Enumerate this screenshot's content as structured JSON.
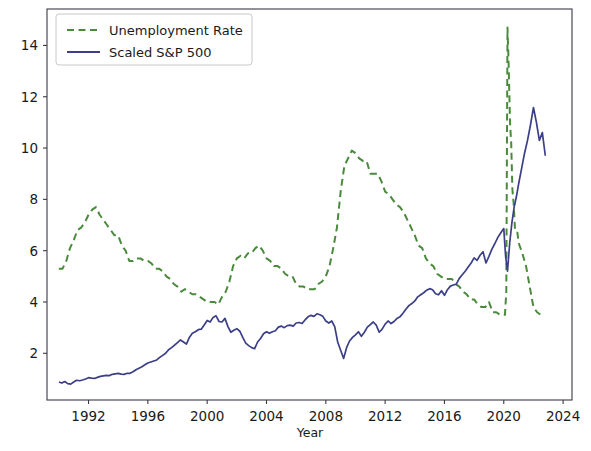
{
  "chart_data": {
    "type": "line",
    "title": "",
    "xlabel": "Year",
    "ylabel": "",
    "xlim": [
      1989.2,
      2024.6
    ],
    "ylim": [
      0.18,
      15.42
    ],
    "grid": false,
    "legend_position": "upper left",
    "xticks": [
      1992,
      1996,
      2000,
      2004,
      2008,
      2012,
      2016,
      2020,
      2024
    ],
    "xtick_labels": [
      "1992",
      "1996",
      "2000",
      "2004",
      "2008",
      "2012",
      "2016",
      "2020",
      "2024"
    ],
    "yticks": [
      2,
      4,
      6,
      8,
      10,
      12,
      14
    ],
    "ytick_labels": [
      "2",
      "4",
      "6",
      "8",
      "10",
      "12",
      "14"
    ],
    "series": [
      {
        "name": "Unemployment Rate",
        "color": "#4a8a3c",
        "linestyle": "dashed",
        "linewidth": 2.0,
        "x": [
          1990.0,
          1990.25,
          1990.5,
          1990.75,
          1991.0,
          1991.25,
          1991.5,
          1991.75,
          1992.0,
          1992.25,
          1992.5,
          1992.75,
          1993.0,
          1993.25,
          1993.5,
          1993.75,
          1994.0,
          1994.25,
          1994.5,
          1994.75,
          1995.0,
          1995.25,
          1995.5,
          1995.75,
          1996.0,
          1996.25,
          1996.5,
          1996.75,
          1997.0,
          1997.25,
          1997.5,
          1997.75,
          1998.0,
          1998.25,
          1998.5,
          1998.75,
          1999.0,
          1999.25,
          1999.5,
          1999.75,
          2000.0,
          2000.25,
          2000.5,
          2000.75,
          2001.0,
          2001.25,
          2001.5,
          2001.75,
          2002.0,
          2002.25,
          2002.5,
          2002.75,
          2003.0,
          2003.25,
          2003.5,
          2003.75,
          2004.0,
          2004.25,
          2004.5,
          2004.75,
          2005.0,
          2005.25,
          2005.5,
          2005.75,
          2006.0,
          2006.25,
          2006.5,
          2006.75,
          2007.0,
          2007.25,
          2007.5,
          2007.75,
          2008.0,
          2008.25,
          2008.5,
          2008.75,
          2009.0,
          2009.25,
          2009.5,
          2009.75,
          2010.0,
          2010.25,
          2010.5,
          2010.75,
          2011.0,
          2011.25,
          2011.5,
          2011.75,
          2012.0,
          2012.25,
          2012.5,
          2012.75,
          2013.0,
          2013.25,
          2013.5,
          2013.75,
          2014.0,
          2014.25,
          2014.5,
          2014.75,
          2015.0,
          2015.25,
          2015.5,
          2015.75,
          2016.0,
          2016.25,
          2016.5,
          2016.75,
          2017.0,
          2017.25,
          2017.5,
          2017.75,
          2018.0,
          2018.25,
          2018.5,
          2018.75,
          2019.0,
          2019.25,
          2019.5,
          2019.75,
          2020.0,
          2020.08,
          2020.17,
          2020.25,
          2020.33,
          2020.42,
          2020.5,
          2020.58,
          2020.67,
          2020.75,
          2020.83,
          2020.92,
          2021.0,
          2021.25,
          2021.5,
          2021.75,
          2022.0,
          2022.25,
          2022.5,
          2022.75
        ],
        "y": [
          5.3,
          5.3,
          5.6,
          6.1,
          6.4,
          6.8,
          6.9,
          7.1,
          7.4,
          7.6,
          7.7,
          7.4,
          7.2,
          7.0,
          6.8,
          6.6,
          6.6,
          6.2,
          6.0,
          5.6,
          5.6,
          5.7,
          5.7,
          5.6,
          5.6,
          5.5,
          5.3,
          5.3,
          5.2,
          5.0,
          4.9,
          4.7,
          4.6,
          4.4,
          4.5,
          4.4,
          4.3,
          4.3,
          4.2,
          4.1,
          4.0,
          4.0,
          4.0,
          3.9,
          4.2,
          4.4,
          4.8,
          5.4,
          5.7,
          5.8,
          5.7,
          5.9,
          5.9,
          6.1,
          6.2,
          6.0,
          5.7,
          5.6,
          5.4,
          5.4,
          5.3,
          5.1,
          5.0,
          5.0,
          4.7,
          4.6,
          4.6,
          4.5,
          4.5,
          4.5,
          4.7,
          4.8,
          5.0,
          5.4,
          6.1,
          6.9,
          8.3,
          9.3,
          9.6,
          9.9,
          9.8,
          9.6,
          9.5,
          9.5,
          9.0,
          9.0,
          9.0,
          8.7,
          8.3,
          8.2,
          8.0,
          7.8,
          7.7,
          7.5,
          7.2,
          6.9,
          6.6,
          6.2,
          6.1,
          5.7,
          5.5,
          5.4,
          5.1,
          5.0,
          4.9,
          4.9,
          4.9,
          4.7,
          4.6,
          4.4,
          4.3,
          4.1,
          4.1,
          3.9,
          3.8,
          3.8,
          4.0,
          3.6,
          3.6,
          3.5,
          3.5,
          3.5,
          4.4,
          14.7,
          13.2,
          11.0,
          10.2,
          8.4,
          7.8,
          6.9,
          6.7,
          6.7,
          6.3,
          5.9,
          5.4,
          4.6,
          3.8,
          3.6,
          3.5,
          3.5
        ]
      },
      {
        "name": "Scaled S&P 500",
        "color": "#3b3f87",
        "linestyle": "solid",
        "linewidth": 1.7,
        "x": [
          1990.0,
          1990.2,
          1990.4,
          1990.6,
          1990.8,
          1991.0,
          1991.2,
          1991.4,
          1991.6,
          1991.8,
          1992.0,
          1992.2,
          1992.4,
          1992.6,
          1992.8,
          1993.0,
          1993.2,
          1993.4,
          1993.6,
          1993.8,
          1994.0,
          1994.2,
          1994.4,
          1994.6,
          1994.8,
          1995.0,
          1995.2,
          1995.4,
          1995.6,
          1995.8,
          1996.0,
          1996.2,
          1996.4,
          1996.6,
          1996.8,
          1997.0,
          1997.2,
          1997.4,
          1997.6,
          1997.8,
          1998.0,
          1998.2,
          1998.4,
          1998.6,
          1998.8,
          1999.0,
          1999.2,
          1999.4,
          1999.6,
          1999.8,
          2000.0,
          2000.2,
          2000.4,
          2000.6,
          2000.8,
          2001.0,
          2001.2,
          2001.4,
          2001.6,
          2001.8,
          2002.0,
          2002.2,
          2002.4,
          2002.6,
          2002.8,
          2003.0,
          2003.2,
          2003.4,
          2003.6,
          2003.8,
          2004.0,
          2004.2,
          2004.4,
          2004.6,
          2004.8,
          2005.0,
          2005.2,
          2005.4,
          2005.6,
          2005.8,
          2006.0,
          2006.2,
          2006.4,
          2006.6,
          2006.8,
          2007.0,
          2007.2,
          2007.4,
          2007.6,
          2007.8,
          2008.0,
          2008.2,
          2008.4,
          2008.6,
          2008.8,
          2009.0,
          2009.2,
          2009.4,
          2009.6,
          2009.8,
          2010.0,
          2010.2,
          2010.4,
          2010.6,
          2010.8,
          2011.0,
          2011.2,
          2011.4,
          2011.6,
          2011.8,
          2012.0,
          2012.2,
          2012.4,
          2012.6,
          2012.8,
          2013.0,
          2013.2,
          2013.4,
          2013.6,
          2013.8,
          2014.0,
          2014.2,
          2014.4,
          2014.6,
          2014.8,
          2015.0,
          2015.2,
          2015.4,
          2015.6,
          2015.8,
          2016.0,
          2016.2,
          2016.4,
          2016.6,
          2016.8,
          2017.0,
          2017.2,
          2017.4,
          2017.6,
          2017.8,
          2018.0,
          2018.2,
          2018.4,
          2018.6,
          2018.8,
          2019.0,
          2019.2,
          2019.4,
          2019.6,
          2019.8,
          2020.0,
          2020.12,
          2020.25,
          2020.4,
          2020.55,
          2020.7,
          2020.85,
          2021.0,
          2021.2,
          2021.4,
          2021.6,
          2021.8,
          2022.0,
          2022.2,
          2022.4,
          2022.6,
          2022.8
        ],
        "y": [
          0.88,
          0.84,
          0.9,
          0.82,
          0.8,
          0.88,
          0.95,
          0.93,
          0.96,
          1.0,
          1.05,
          1.03,
          1.02,
          1.06,
          1.1,
          1.12,
          1.14,
          1.13,
          1.18,
          1.2,
          1.22,
          1.19,
          1.18,
          1.22,
          1.22,
          1.28,
          1.36,
          1.42,
          1.48,
          1.55,
          1.62,
          1.66,
          1.7,
          1.74,
          1.84,
          1.92,
          2.0,
          2.14,
          2.22,
          2.32,
          2.42,
          2.52,
          2.44,
          2.36,
          2.62,
          2.78,
          2.84,
          2.92,
          2.94,
          3.1,
          3.28,
          3.22,
          3.4,
          3.46,
          3.24,
          3.22,
          3.36,
          3.04,
          2.82,
          2.9,
          2.96,
          2.86,
          2.62,
          2.4,
          2.3,
          2.22,
          2.18,
          2.44,
          2.58,
          2.76,
          2.84,
          2.78,
          2.84,
          2.88,
          3.02,
          3.06,
          3.0,
          3.08,
          3.1,
          3.06,
          3.18,
          3.2,
          3.16,
          3.3,
          3.42,
          3.48,
          3.44,
          3.54,
          3.5,
          3.44,
          3.26,
          3.18,
          3.26,
          3.04,
          2.44,
          2.12,
          1.8,
          2.22,
          2.48,
          2.62,
          2.72,
          2.84,
          2.66,
          2.82,
          3.02,
          3.12,
          3.22,
          3.1,
          2.82,
          2.94,
          3.14,
          3.26,
          3.16,
          3.24,
          3.36,
          3.42,
          3.56,
          3.72,
          3.86,
          3.94,
          4.04,
          4.2,
          4.28,
          4.36,
          4.46,
          4.52,
          4.48,
          4.32,
          4.28,
          4.44,
          4.26,
          4.48,
          4.62,
          4.66,
          4.7,
          4.92,
          5.06,
          5.2,
          5.36,
          5.52,
          5.72,
          5.62,
          5.82,
          5.96,
          5.52,
          5.78,
          6.06,
          6.28,
          6.52,
          6.7,
          6.86,
          5.8,
          5.2,
          6.3,
          7.1,
          7.7,
          8.1,
          8.6,
          9.2,
          9.8,
          10.3,
          10.9,
          11.58,
          11.0,
          10.3,
          10.6,
          9.7
        ]
      }
    ]
  },
  "axes": {
    "xlabel": "Year",
    "tick_font_size": 13.5
  },
  "legend": {
    "entries": [
      {
        "label": "Unemployment Rate",
        "color": "#4a8a3c",
        "style": "dashed"
      },
      {
        "label": "Scaled S&P 500",
        "color": "#3b3f87",
        "style": "solid"
      }
    ]
  }
}
